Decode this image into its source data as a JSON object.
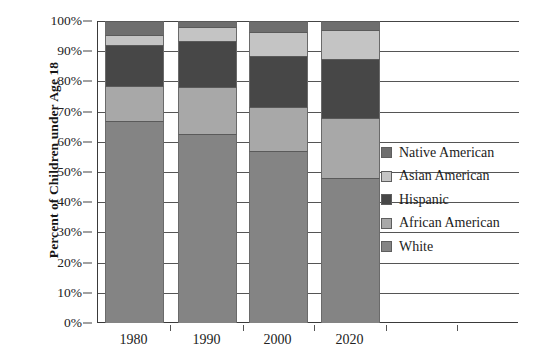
{
  "chart_data": {
    "type": "bar",
    "subtype": "stacked-bar-100-percent",
    "title": "",
    "xlabel": "",
    "ylabel": "Percent of Children under Age 18",
    "categories": [
      "1980",
      "1990",
      "2000",
      "2020"
    ],
    "ylim": [
      0,
      100
    ],
    "ytick_labels": [
      "0%",
      "10%",
      "20%",
      "30%",
      "40%",
      "50%",
      "60%",
      "70%",
      "80%",
      "90%",
      "100%"
    ],
    "ytick_values": [
      0,
      10,
      20,
      30,
      40,
      50,
      60,
      70,
      80,
      90,
      100
    ],
    "grid": true,
    "grid_axis": "y",
    "legend_position": "right-middle",
    "stack_order_bottom_to_top": [
      "White",
      "African American",
      "Hispanic",
      "Asian American",
      "Native American"
    ],
    "series": [
      {
        "name": "White",
        "color": "#848484",
        "values": [
          67,
          62.5,
          57,
          48
        ]
      },
      {
        "name": "African American",
        "color": "#a8a8a8",
        "values": [
          11.5,
          15.5,
          14.5,
          20
        ]
      },
      {
        "name": "Hispanic",
        "color": "#474747",
        "values": [
          13.5,
          15.5,
          17,
          19.5
        ]
      },
      {
        "name": "Asian American",
        "color": "#c4c4c4",
        "values": [
          3.5,
          4.5,
          8,
          9.5
        ]
      },
      {
        "name": "Native American",
        "color": "#6e6e6e",
        "values": [
          4.5,
          2,
          3.5,
          3
        ]
      }
    ],
    "legend_entries": [
      {
        "label": "Native American",
        "color": "#6e6e6e"
      },
      {
        "label": "Asian American",
        "color": "#c4c4c4"
      },
      {
        "label": "Hispanic",
        "color": "#474747"
      },
      {
        "label": "African American",
        "color": "#a8a8a8"
      },
      {
        "label": "White",
        "color": "#848484"
      }
    ]
  },
  "colors": {
    "axis": "#3a3a3a",
    "gridline": "#555555",
    "text": "#1a1a1a",
    "background": "#ffffff"
  }
}
